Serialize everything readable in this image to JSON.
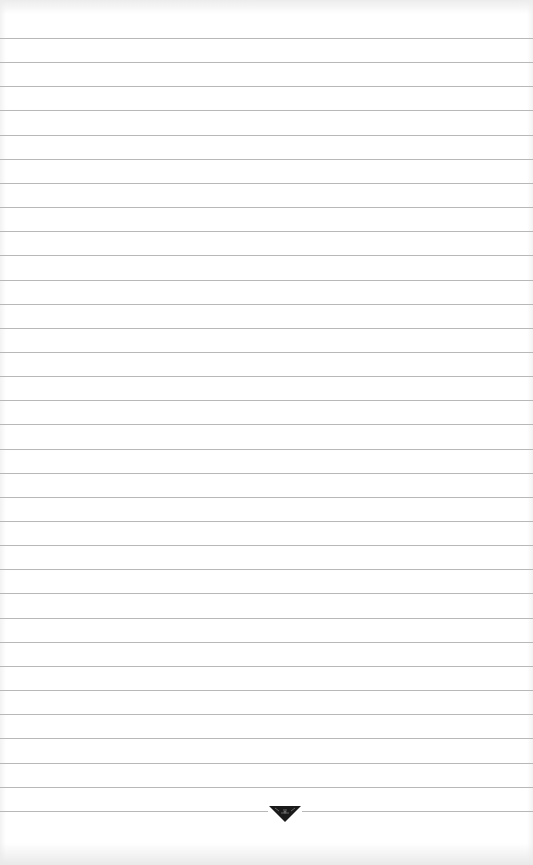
{
  "page": {
    "type": "lined-paper",
    "background_color": "#ffffff",
    "line_color": "#b8b8b8",
    "line_count": 33,
    "first_line_y": 38,
    "line_spacing": 24.15
  },
  "ornament": {
    "icon": "down-triangle-ornament-icon",
    "color": "#1a1a1a"
  }
}
